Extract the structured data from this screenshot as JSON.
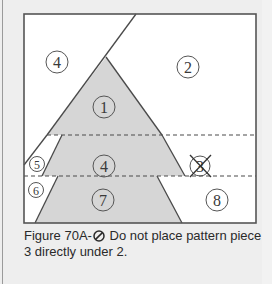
{
  "figure": {
    "caption_prefix": "Figure 70A-",
    "caption_icon": "no-symbol-icon",
    "caption_text": " Do not place pattern piece 3 directly under 2."
  },
  "pieces": [
    {
      "id": "piece-1",
      "label": "1",
      "shaded": true
    },
    {
      "id": "piece-2",
      "label": "2",
      "shaded": false
    },
    {
      "id": "piece-3",
      "label": "3",
      "shaded": false,
      "crossed_out": true
    },
    {
      "id": "piece-4-top",
      "label": "4",
      "shaded": false
    },
    {
      "id": "piece-4-middle",
      "label": "4",
      "shaded": true
    },
    {
      "id": "piece-5",
      "label": "5",
      "shaded": false
    },
    {
      "id": "piece-6",
      "label": "6",
      "shaded": false
    },
    {
      "id": "piece-7",
      "label": "7",
      "shaded": true
    },
    {
      "id": "piece-8",
      "label": "8",
      "shaded": false
    }
  ],
  "colors": {
    "shade": "#d6d6d6",
    "line": "#4a4a4a",
    "background": "#eeeeee",
    "frame_fill": "#ffffff"
  }
}
